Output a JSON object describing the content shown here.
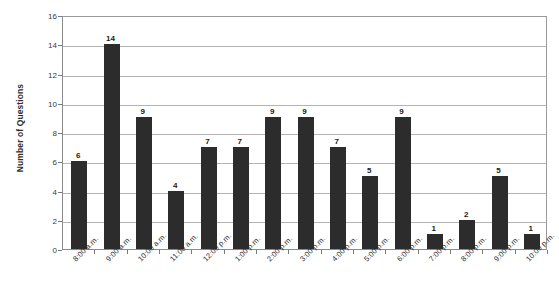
{
  "chart_data": {
    "type": "bar",
    "title": "",
    "xlabel": "",
    "ylabel": "Number of Questions",
    "ylim": [
      0,
      16
    ],
    "ytick_step": 2,
    "yticks": [
      0,
      2,
      4,
      6,
      8,
      10,
      12,
      14,
      16
    ],
    "ytick_labels": [
      "0",
      "2",
      "4",
      "6",
      "8",
      "10",
      "12",
      "14",
      "16"
    ],
    "grid": "horizontal",
    "legend": "none",
    "bar_color": "#2c2c2c",
    "show_value_labels": true,
    "categories": [
      "8:00 a.m.",
      "9:00 a.m.",
      "10:00 a.m.",
      "11:00 a.m.",
      "12:00 p.m.",
      "1:00 p.m.",
      "2:00 p.m.",
      "3:00 p.m.",
      "4:00 p.m.",
      "5:00 p.m.",
      "6:00 p.m.",
      "7:00 p.m.",
      "8:00 p.m.",
      "9:00 p.m.",
      "10:00 p.m."
    ],
    "values": [
      6,
      14,
      9,
      4,
      7,
      7,
      9,
      9,
      7,
      5,
      9,
      1,
      2,
      5,
      1
    ],
    "value_labels": [
      "6",
      "14",
      "9",
      "4",
      "7",
      "7",
      "9",
      "9",
      "7",
      "5",
      "9",
      "1",
      "2",
      "5",
      "1"
    ]
  }
}
